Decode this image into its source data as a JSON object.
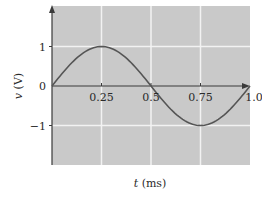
{
  "chart_data": {
    "type": "line",
    "title": "",
    "xlabel": "t (ms)",
    "ylabel": "v (V)",
    "xlabel_var": "t",
    "xlabel_unit": "(ms)",
    "ylabel_var": "v",
    "ylabel_unit": "(V)",
    "xlim": [
      0,
      1.0
    ],
    "ylim": [
      -2,
      2
    ],
    "x_ticks": [
      "0.25",
      "0.5",
      "0.75",
      "1.0"
    ],
    "y_ticks": [
      "1",
      "0",
      "-1"
    ],
    "grid": true,
    "legend": null,
    "series": [
      {
        "name": "v(t) = sin(2π·t/1ms)",
        "x": [
          0,
          0.125,
          0.25,
          0.375,
          0.5,
          0.625,
          0.75,
          0.875,
          1.0
        ],
        "values": [
          0,
          0.71,
          1,
          0.71,
          0,
          -0.71,
          -1,
          -0.71,
          0
        ]
      }
    ],
    "colors": {
      "plot_background": "#c9c9c9",
      "grid": "#f2f2f2",
      "axis": "#3a3a3a",
      "curve": "#555555",
      "text": "#2a2a2a"
    }
  }
}
